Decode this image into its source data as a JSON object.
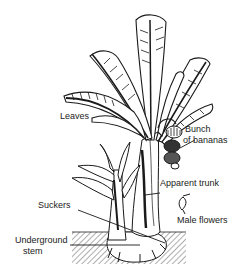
{
  "diagram": {
    "labels": {
      "leaves": "Leaves",
      "bunch_line1": "Bunch",
      "bunch_line2": "of bananas",
      "apparent_trunk": "Apparent trunk",
      "male_flowers": "Male flowers",
      "suckers": "Suckers",
      "underground_line1": "Underground",
      "underground_line2": "stem"
    },
    "colors": {
      "ink": "#1a1a1a",
      "background": "#ffffff"
    }
  }
}
